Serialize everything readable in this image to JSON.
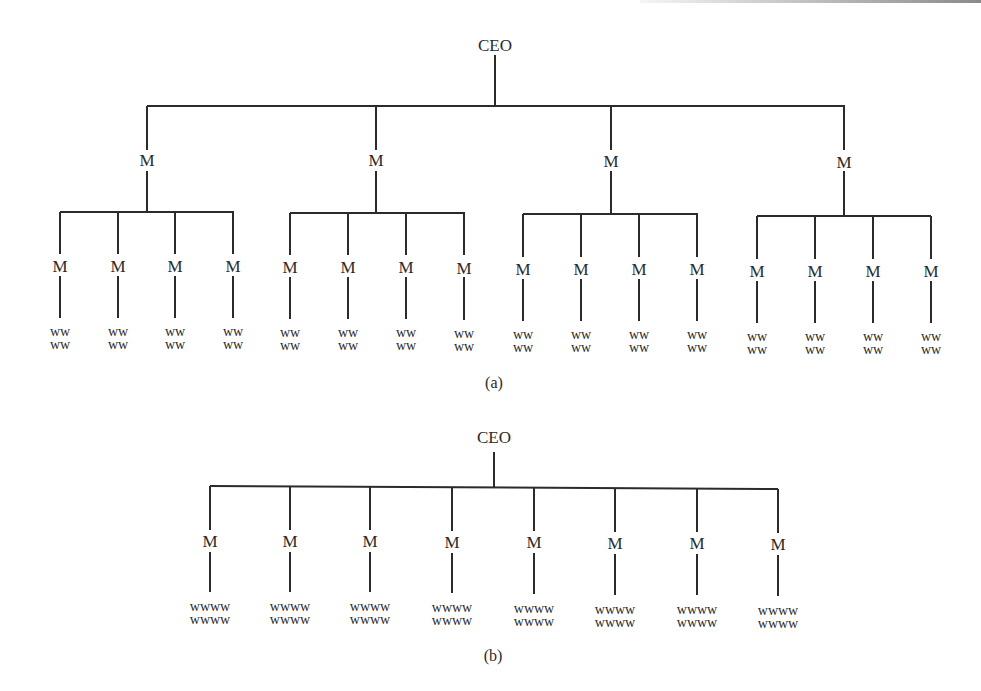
{
  "diagram_a": {
    "root_label": "CEO",
    "caption": "(a)",
    "managers": [
      {
        "label": "M",
        "subordinates": [
          {
            "label": "M",
            "workers": [
              "ww",
              "ww"
            ]
          },
          {
            "label": "M",
            "workers": [
              "ww",
              "ww"
            ]
          },
          {
            "label": "M",
            "workers": [
              "ww",
              "ww"
            ]
          },
          {
            "label": "M",
            "workers": [
              "ww",
              "ww"
            ]
          }
        ]
      },
      {
        "label": "M",
        "subordinates": [
          {
            "label": "M",
            "workers": [
              "ww",
              "ww"
            ]
          },
          {
            "label": "M",
            "workers": [
              "ww",
              "ww"
            ]
          },
          {
            "label": "M",
            "workers": [
              "ww",
              "ww"
            ]
          },
          {
            "label": "M",
            "workers": [
              "ww",
              "ww"
            ]
          }
        ]
      },
      {
        "label": "M",
        "subordinates": [
          {
            "label": "M",
            "workers": [
              "ww",
              "ww"
            ]
          },
          {
            "label": "M",
            "workers": [
              "ww",
              "ww"
            ]
          },
          {
            "label": "M",
            "workers": [
              "ww",
              "ww"
            ]
          },
          {
            "label": "M",
            "workers": [
              "ww",
              "ww"
            ]
          }
        ]
      },
      {
        "label": "M",
        "subordinates": [
          {
            "label": "M",
            "workers": [
              "ww",
              "ww"
            ]
          },
          {
            "label": "M",
            "workers": [
              "ww",
              "ww"
            ]
          },
          {
            "label": "M",
            "workers": [
              "ww",
              "ww"
            ]
          },
          {
            "label": "M",
            "workers": [
              "ww",
              "ww"
            ]
          }
        ]
      }
    ]
  },
  "diagram_b": {
    "root_label": "CEO",
    "caption": "(b)",
    "managers": [
      {
        "label": "M",
        "workers": [
          "wwww",
          "wwww"
        ]
      },
      {
        "label": "M",
        "workers": [
          "wwww",
          "wwww"
        ]
      },
      {
        "label": "M",
        "workers": [
          "wwww",
          "wwww"
        ]
      },
      {
        "label": "M",
        "workers": [
          "wwww",
          "wwww"
        ]
      },
      {
        "label": "M",
        "workers": [
          "wwww",
          "wwww"
        ]
      },
      {
        "label": "M",
        "workers": [
          "wwww",
          "wwww"
        ]
      },
      {
        "label": "M",
        "workers": [
          "wwww",
          "wwww"
        ]
      },
      {
        "label": "M",
        "workers": [
          "wwww",
          "wwww"
        ]
      }
    ]
  },
  "style": {
    "line_color": "#2b2b2b",
    "text_color": "#2a2a2a",
    "background": "#ffffff"
  }
}
